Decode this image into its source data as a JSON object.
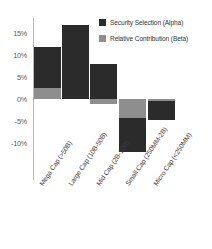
{
  "chart_data": {
    "type": "bar",
    "subtype": "stacked-bar-diverging",
    "title": "",
    "xlabel": "",
    "ylabel": "",
    "ylim": [
      -12.5,
      17.5
    ],
    "grid": false,
    "legend_position": "top-right",
    "yticks": [
      "15%",
      "10%",
      "5%",
      "0%",
      "-5%",
      "-10%"
    ],
    "ytick_values": [
      15,
      10,
      5,
      0,
      -5,
      -10
    ],
    "categories": [
      "Mega Cap (>50B)",
      "Large Cap (10B-50B)",
      "Mid Cap (2B-10B)",
      "Small Cap (250MM-2B)",
      "Micro Cap (<250MM)"
    ],
    "series": [
      {
        "name": "Security Selection (Alpha)",
        "color": "#2b2b2b",
        "values": [
          9.3,
          16.8,
          7.9,
          -7.7,
          -4.3
        ]
      },
      {
        "name": "Relative Contribution (Beta)",
        "color": "#8e8e8e",
        "values": [
          2.5,
          0.0,
          -1.2,
          -4.3,
          -0.5
        ]
      }
    ]
  },
  "legend": {
    "items": [
      {
        "label": "Security Selection (Alpha)",
        "swatch": "#2b2b2b"
      },
      {
        "label": "Relative Contribution (Beta)",
        "swatch": "#8e8e8e"
      }
    ]
  },
  "axis": {
    "y": {
      "ticks": [
        {
          "label": "15%"
        },
        {
          "label": "10%"
        },
        {
          "label": "5%"
        },
        {
          "label": "0%"
        },
        {
          "label": "-5%"
        },
        {
          "label": "-10%"
        }
      ]
    },
    "x": {
      "ticks": [
        {
          "label": "Mega Cap (>50B)"
        },
        {
          "label": "Large Cap (10B-50B)"
        },
        {
          "label": "Mid Cap (2B-10B)"
        },
        {
          "label": "Small Cap (250MM-2B)"
        },
        {
          "label": "Micro Cap (<250MM)"
        }
      ]
    }
  }
}
